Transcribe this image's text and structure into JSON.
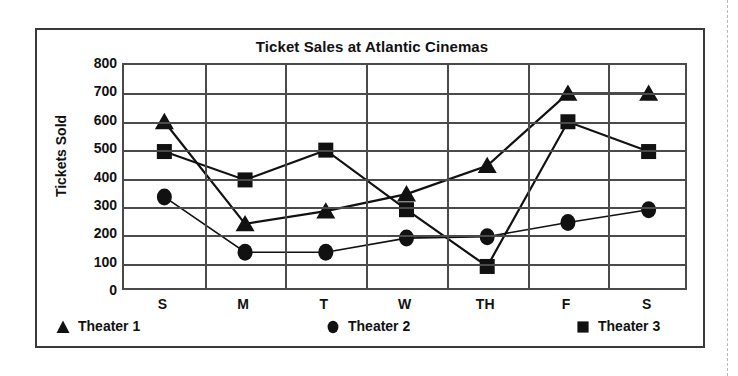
{
  "chart_data": {
    "type": "line",
    "title": "Ticket Sales at Atlantic Cinemas",
    "xlabel": "",
    "ylabel": "Tickets Sold",
    "categories": [
      "S",
      "M",
      "T",
      "W",
      "TH",
      "F",
      "S"
    ],
    "ylim": [
      0,
      800
    ],
    "yticks": [
      0,
      100,
      200,
      300,
      400,
      500,
      600,
      700,
      800
    ],
    "ytick_labels": [
      "0",
      "100",
      "200",
      "300",
      "400",
      "500",
      "600",
      "700",
      "800"
    ],
    "grid": "both",
    "legend_position": "bottom",
    "series": [
      {
        "name": "Theater 1",
        "marker": "triangle",
        "color": "#111111",
        "values": [
          600,
          240,
          285,
          345,
          445,
          700,
          700
        ]
      },
      {
        "name": "Theater 2",
        "marker": "circle",
        "color": "#111111",
        "values": [
          335,
          140,
          140,
          190,
          195,
          245,
          290
        ]
      },
      {
        "name": "Theater 3",
        "marker": "square",
        "color": "#111111",
        "values": [
          495,
          395,
          500,
          290,
          90,
          600,
          495
        ]
      }
    ]
  },
  "figure": {
    "title": "Ticket Sales at Atlantic Cinemas",
    "y_axis_title": "Tickets Sold",
    "frame_color": "#3a3a3a",
    "axis_color": "#4a4a4a",
    "ink_color": "#111111",
    "background": "#ffffff"
  },
  "legend": {
    "items": [
      {
        "label": "Theater 1",
        "marker": "triangle"
      },
      {
        "label": "Theater 2",
        "marker": "circle"
      },
      {
        "label": "Theater 3",
        "marker": "square"
      }
    ]
  }
}
